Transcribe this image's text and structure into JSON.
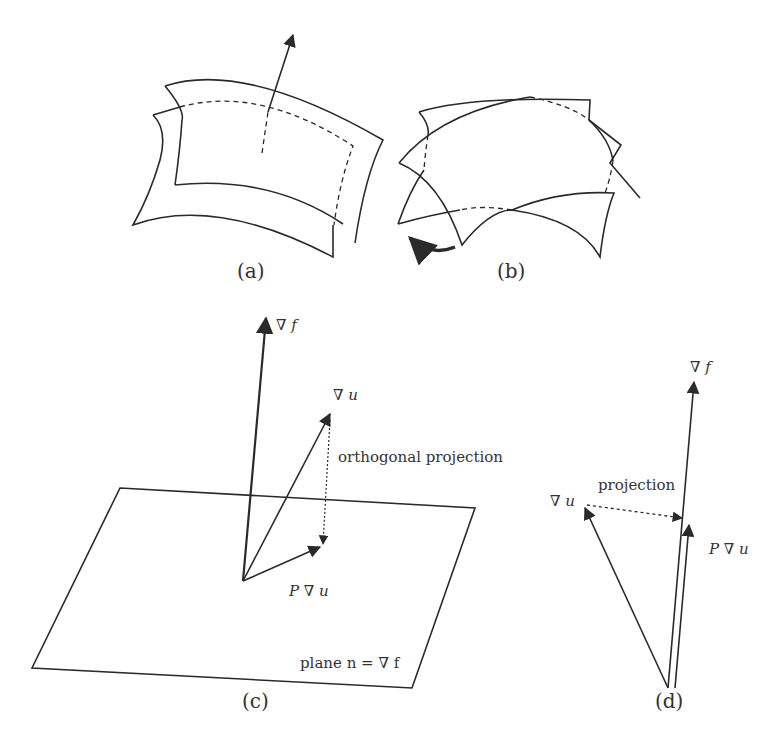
{
  "figure": {
    "panels": [
      {
        "id": "a",
        "caption": "(a)",
        "description": "two offset curved surface sheets with normal arrow"
      },
      {
        "id": "b",
        "caption": "(b)",
        "description": "two twisted overlapping curved sheets with curved rotation arrow"
      },
      {
        "id": "c",
        "caption": "(c)",
        "labels": {
          "grad_f": "∇ f",
          "grad_u": "∇ u",
          "proj_label": "orthogonal projection",
          "p_grad_u": "P ∇ u",
          "plane_label": "plane n = ∇ f"
        }
      },
      {
        "id": "d",
        "caption": "(d)",
        "labels": {
          "grad_f": "∇ f",
          "grad_u": "∇ u",
          "proj_label": "projection",
          "p_grad_u": "P ∇ u"
        }
      }
    ]
  },
  "colors": {
    "line": "#2a2a2a",
    "background": "#ffffff"
  }
}
